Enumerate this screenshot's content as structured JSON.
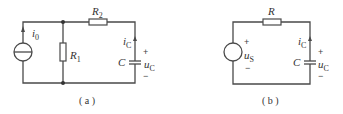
{
  "figure": {
    "panels": [
      {
        "id": "a",
        "caption": "( a )",
        "components": {
          "source": {
            "type": "current-source",
            "label": "i",
            "sub": "0"
          },
          "r1": {
            "label": "R",
            "sub": "1"
          },
          "r2": {
            "label": "R",
            "sub": "2"
          },
          "capacitor": {
            "label": "C"
          },
          "current": {
            "label": "i",
            "sub": "C"
          },
          "voltage": {
            "label": "u",
            "sub": "C",
            "plus": "+",
            "minus": "−"
          }
        }
      },
      {
        "id": "b",
        "caption": "( b )",
        "components": {
          "source": {
            "type": "voltage-source",
            "label": "u",
            "sub": "S",
            "plus": "+",
            "minus": "−"
          },
          "r": {
            "label": "R"
          },
          "capacitor": {
            "label": "C"
          },
          "current": {
            "label": "i",
            "sub": "C"
          },
          "voltage": {
            "label": "u",
            "sub": "C",
            "plus": "+",
            "minus": "−"
          }
        }
      }
    ]
  },
  "colors": {
    "wire": "#4a4a4a",
    "text": "#333333",
    "background": "#ffffff"
  }
}
